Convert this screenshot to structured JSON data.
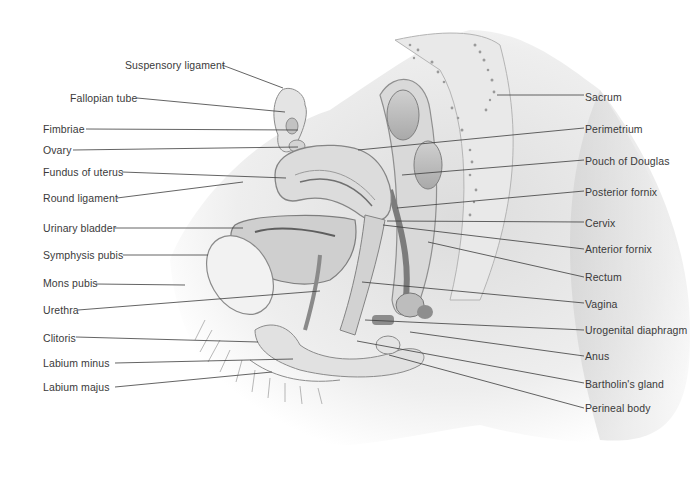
{
  "diagram": {
    "type": "anatomical-sagittal-section",
    "colors": {
      "background": "#ffffff",
      "label_text": "#3a3a3a",
      "leader_line": "#3c3c3c",
      "tissue_light": "#e8e8e8",
      "tissue_mid": "#c9c9c9",
      "tissue_dark": "#8e8e8e"
    },
    "left_labels": [
      {
        "text": "Suspensory ligament",
        "x": 125,
        "y": 59,
        "line": [
          222,
          65,
          283,
          88
        ]
      },
      {
        "text": "Fallopian tube",
        "x": 70,
        "y": 92,
        "line": [
          137,
          98,
          285,
          112
        ]
      },
      {
        "text": "Fimbriae",
        "x": 43,
        "y": 123,
        "line": [
          86,
          129,
          298,
          130
        ]
      },
      {
        "text": "Ovary",
        "x": 43,
        "y": 144,
        "line": [
          73,
          150,
          298,
          147
        ]
      },
      {
        "text": "Fundus of uterus",
        "x": 43,
        "y": 166,
        "line": [
          122,
          172,
          286,
          178
        ]
      },
      {
        "text": "Round ligament",
        "x": 43,
        "y": 192,
        "line": [
          117,
          198,
          243,
          182
        ]
      },
      {
        "text": "Urinary bladder",
        "x": 43,
        "y": 222,
        "line": [
          115,
          228,
          243,
          228
        ]
      },
      {
        "text": "Symphysis pubis",
        "x": 43,
        "y": 249,
        "line": [
          123,
          255,
          208,
          255
        ]
      },
      {
        "text": "Mons pubis",
        "x": 43,
        "y": 277,
        "line": [
          96,
          284,
          185,
          285
        ]
      },
      {
        "text": "Urethra",
        "x": 43,
        "y": 304,
        "line": [
          78,
          310,
          320,
          291
        ]
      },
      {
        "text": "Clitoris",
        "x": 43,
        "y": 332,
        "line": [
          76,
          337,
          258,
          342
        ]
      },
      {
        "text": "Labium minus",
        "x": 43,
        "y": 357,
        "line": [
          115,
          363,
          293,
          359
        ]
      },
      {
        "text": "Labium majus",
        "x": 43,
        "y": 381,
        "line": [
          115,
          387,
          272,
          372
        ]
      }
    ],
    "right_labels": [
      {
        "text": "Sacrum",
        "x": 585,
        "y": 91,
        "line": [
          497,
          95,
          584,
          95
        ]
      },
      {
        "text": "Perimetrium",
        "x": 585,
        "y": 123,
        "line": [
          358,
          150,
          584,
          128
        ]
      },
      {
        "text": "Pouch of Douglas",
        "x": 585,
        "y": 155,
        "line": [
          402,
          175,
          584,
          160
        ]
      },
      {
        "text": "Posterior fornix",
        "x": 585,
        "y": 186,
        "line": [
          397,
          208,
          584,
          191
        ]
      },
      {
        "text": "Cervix",
        "x": 585,
        "y": 217,
        "line": [
          387,
          221,
          584,
          222
        ]
      },
      {
        "text": "Anterior fornix",
        "x": 585,
        "y": 243,
        "line": [
          383,
          225,
          584,
          249
        ]
      },
      {
        "text": "Rectum",
        "x": 585,
        "y": 271,
        "line": [
          428,
          242,
          584,
          277
        ]
      },
      {
        "text": "Vagina",
        "x": 585,
        "y": 298,
        "line": [
          362,
          282,
          584,
          303
        ]
      },
      {
        "text": "Urogenital diaphragm",
        "x": 585,
        "y": 324,
        "line": [
          365,
          320,
          584,
          330
        ]
      },
      {
        "text": "Anus",
        "x": 585,
        "y": 350,
        "line": [
          410,
          332,
          584,
          356
        ]
      },
      {
        "text": "Bartholin's gland",
        "x": 585,
        "y": 378,
        "line": [
          357,
          341,
          584,
          383
        ]
      },
      {
        "text": "Perineal body",
        "x": 585,
        "y": 402,
        "line": [
          389,
          355,
          584,
          408
        ]
      }
    ]
  }
}
